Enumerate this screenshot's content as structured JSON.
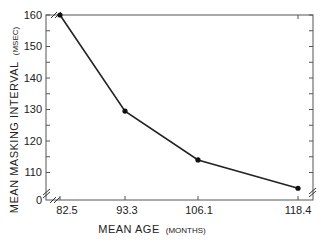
{
  "chart_data": {
    "type": "line",
    "title": "",
    "xlabel": "MEAN AGE",
    "xlabel_unit": "(MONTHS)",
    "ylabel": "MEAN MASKING INTERVAL",
    "ylabel_unit": "(MSEC)",
    "x": [
      "82.5",
      "93.3",
      "106.1",
      "118.4"
    ],
    "series": [
      {
        "name": "Mean masking interval",
        "values": [
          160,
          129.5,
          114,
          105
        ]
      }
    ],
    "y_ticks": [
      "0",
      "110",
      "120",
      "130",
      "140",
      "150",
      "160"
    ],
    "ylim": [
      100,
      160
    ],
    "y_axis_break": true,
    "x_axis_break": true,
    "grid": false,
    "legend": false,
    "line_color": "#222222",
    "marker": "filled-circle"
  },
  "axes": {
    "x_title": "MEAN AGE",
    "x_unit": "(MONTHS)",
    "y_title": "MEAN MASKING INTERVAL",
    "y_unit": "(MSEC)"
  },
  "ticks": {
    "y": [
      {
        "label": "160"
      },
      {
        "label": "150"
      },
      {
        "label": "140"
      },
      {
        "label": "130"
      },
      {
        "label": "120"
      },
      {
        "label": "110"
      },
      {
        "label": "0"
      }
    ],
    "x": [
      {
        "label": "82.5"
      },
      {
        "label": "93.3"
      },
      {
        "label": "106.1"
      },
      {
        "label": "118.4"
      }
    ]
  }
}
